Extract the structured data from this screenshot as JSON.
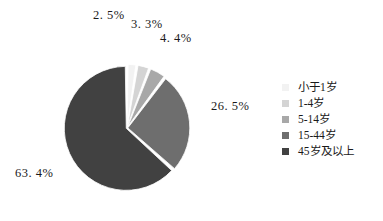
{
  "chart_data": {
    "type": "pie",
    "title": "",
    "subtitle": "",
    "xlabel": "",
    "ylabel": "",
    "grid": false,
    "legend_position": "right",
    "categories": [
      "小于1岁",
      "1-4岁",
      "5-14岁",
      "15-44岁",
      "45岁及以上"
    ],
    "values": [
      2.5,
      3.3,
      4.4,
      26.5,
      63.4
    ],
    "value_labels": [
      "2. 5%",
      "3. 3%",
      "4. 4%",
      "26. 5%",
      "63. 4%"
    ],
    "units": "percent",
    "colors": [
      "#f2f2f2",
      "#d4d4d4",
      "#a8a8a8",
      "#6e6e6e",
      "#414141"
    ],
    "slice_start_angle_deg": 0,
    "slice_direction": "clockwise",
    "exploded": true,
    "slice_gap_px": 2,
    "geometry": {
      "center_x": 127,
      "center_y": 128,
      "radius": 62
    },
    "slices": [
      {
        "label": "小于1岁",
        "value": 2.5,
        "display": "2. 5%",
        "color": "#f2f2f2"
      },
      {
        "label": "1-4岁",
        "value": 3.3,
        "display": "3. 3%",
        "color": "#d4d4d4"
      },
      {
        "label": "5-14岁",
        "value": 4.4,
        "display": "4. 4%",
        "color": "#a8a8a8"
      },
      {
        "label": "15-44岁",
        "value": 26.5,
        "display": "26. 5%",
        "color": "#6e6e6e"
      },
      {
        "label": "45岁及以上",
        "value": 63.4,
        "display": "63. 4%",
        "color": "#414141"
      }
    ]
  },
  "legend": {
    "items": [
      {
        "label": "小于1岁",
        "color": "#f2f2f2"
      },
      {
        "label": "1-4岁",
        "color": "#d4d4d4"
      },
      {
        "label": "5-14岁",
        "color": "#a8a8a8"
      },
      {
        "label": "15-44岁",
        "color": "#6e6e6e"
      },
      {
        "label": "45岁及以上",
        "color": "#414141"
      }
    ]
  },
  "colors": {
    "background": "#ffffff",
    "text": "#1a1a1a",
    "slice_separator": "#ffffff"
  }
}
